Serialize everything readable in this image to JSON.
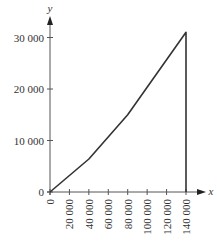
{
  "chart_data": {
    "type": "line",
    "title": "",
    "xlabel": "x",
    "ylabel": "y",
    "xlim": [
      0,
      140000
    ],
    "ylim": [
      0,
      30000
    ],
    "grid": false,
    "legend": null,
    "x_ticks": [
      0,
      20000,
      40000,
      60000,
      80000,
      100000,
      120000,
      140000
    ],
    "x_tick_labels": [
      "0",
      "20 000",
      "40 000",
      "60 000",
      "80 000",
      "100 000",
      "120 000",
      "140 000"
    ],
    "y_ticks": [
      0,
      10000,
      20000,
      30000
    ],
    "y_tick_labels": [
      "0",
      "10 000",
      "20 000",
      "30 000"
    ],
    "series": [
      {
        "name": "y",
        "x": [
          0,
          40000,
          80000,
          140000,
          140000
        ],
        "y": [
          0,
          6400,
          15000,
          31000,
          0
        ]
      }
    ],
    "annotations": [
      "Vertical drop from (140 000, 31 000) to (140 000, 0)"
    ]
  },
  "colors": {
    "line": "#333333",
    "axis": "#555555",
    "background": "#ffffff"
  }
}
